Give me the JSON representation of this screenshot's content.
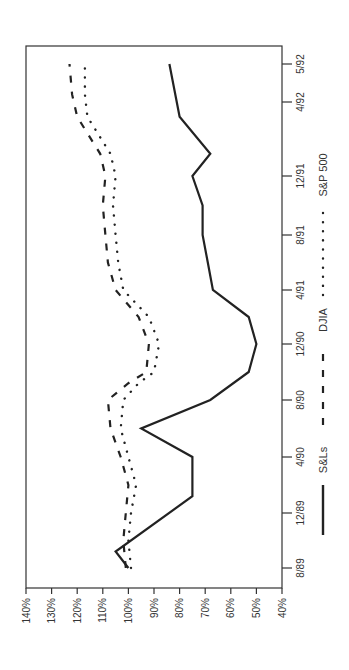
{
  "chart_data": {
    "type": "line",
    "title": "",
    "orientation": "rotated -90deg (x-axis runs bottom-to-top on right edge)",
    "xlabel": "",
    "ylabel": "",
    "x_ticks": [
      "8/89",
      "12/89",
      "4/90",
      "8/90",
      "12/90",
      "4/91",
      "8/91",
      "12/91",
      "4/92",
      "5/92"
    ],
    "y_ticks": [
      "140%",
      "130%",
      "120%",
      "110%",
      "100%",
      "90%",
      "80%",
      "70%",
      "60%",
      "50%",
      "40%"
    ],
    "ylim": [
      40,
      140
    ],
    "grid": false,
    "legend_position": "bottom",
    "series": [
      {
        "name": "S&Ls",
        "style": "solid",
        "points": [
          {
            "x": 0.0,
            "y": 100
          },
          {
            "x": 0.3,
            "y": 105
          },
          {
            "x": 1.3,
            "y": 75
          },
          {
            "x": 2.0,
            "y": 75
          },
          {
            "x": 2.5,
            "y": 95
          },
          {
            "x": 3.0,
            "y": 68
          },
          {
            "x": 3.5,
            "y": 53
          },
          {
            "x": 4.0,
            "y": 50
          },
          {
            "x": 4.5,
            "y": 53
          },
          {
            "x": 5.0,
            "y": 67
          },
          {
            "x": 5.5,
            "y": 69
          },
          {
            "x": 6.0,
            "y": 71
          },
          {
            "x": 6.5,
            "y": 71
          },
          {
            "x": 7.0,
            "y": 75
          },
          {
            "x": 7.0,
            "y": 75
          },
          {
            "x": 7.3,
            "y": 68
          },
          {
            "x": 7.8,
            "y": 80
          },
          {
            "x": 9.0,
            "y": 84
          }
        ]
      },
      {
        "name": "DJIA",
        "style": "dashed",
        "points": [
          {
            "x": 0.0,
            "y": 101
          },
          {
            "x": 0.5,
            "y": 102
          },
          {
            "x": 1.0,
            "y": 101
          },
          {
            "x": 1.5,
            "y": 100
          },
          {
            "x": 2.0,
            "y": 103
          },
          {
            "x": 2.5,
            "y": 107
          },
          {
            "x": 3.0,
            "y": 108
          },
          {
            "x": 3.3,
            "y": 100
          },
          {
            "x": 3.5,
            "y": 93
          },
          {
            "x": 4.0,
            "y": 92
          },
          {
            "x": 4.5,
            "y": 96
          },
          {
            "x": 5.0,
            "y": 105
          },
          {
            "x": 5.5,
            "y": 108
          },
          {
            "x": 6.0,
            "y": 109
          },
          {
            "x": 6.5,
            "y": 110
          },
          {
            "x": 7.0,
            "y": 109
          },
          {
            "x": 7.3,
            "y": 111
          },
          {
            "x": 7.8,
            "y": 120
          },
          {
            "x": 8.2,
            "y": 122
          },
          {
            "x": 9.0,
            "y": 123
          }
        ]
      },
      {
        "name": "S&P 500",
        "style": "dotted",
        "points": [
          {
            "x": 0.0,
            "y": 99
          },
          {
            "x": 0.5,
            "y": 100
          },
          {
            "x": 1.0,
            "y": 99
          },
          {
            "x": 1.5,
            "y": 97
          },
          {
            "x": 2.0,
            "y": 100
          },
          {
            "x": 2.5,
            "y": 103
          },
          {
            "x": 3.0,
            "y": 102
          },
          {
            "x": 3.3,
            "y": 96
          },
          {
            "x": 3.5,
            "y": 90
          },
          {
            "x": 4.0,
            "y": 88
          },
          {
            "x": 4.5,
            "y": 92
          },
          {
            "x": 5.0,
            "y": 102
          },
          {
            "x": 5.5,
            "y": 104
          },
          {
            "x": 6.0,
            "y": 105
          },
          {
            "x": 6.5,
            "y": 106
          },
          {
            "x": 7.0,
            "y": 105
          },
          {
            "x": 7.3,
            "y": 107
          },
          {
            "x": 7.8,
            "y": 116
          },
          {
            "x": 8.2,
            "y": 117
          },
          {
            "x": 9.0,
            "y": 117
          }
        ]
      }
    ]
  },
  "legend": [
    {
      "label": "S&Ls",
      "style": "solid"
    },
    {
      "label": "DJIA",
      "style": "dashed"
    },
    {
      "label": "S&P 500",
      "style": "dotted"
    }
  ],
  "colors": {
    "line": "#222222",
    "axis": "#333333",
    "text": "#333333",
    "background": "#ffffff"
  }
}
